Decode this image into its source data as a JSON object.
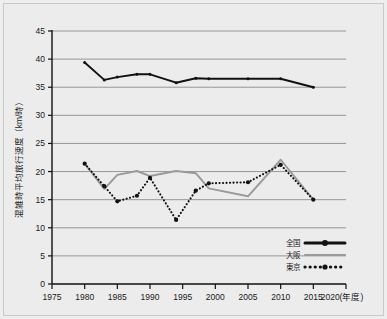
{
  "chart_data": {
    "type": "line",
    "title": "",
    "xlabel": "年度",
    "ylabel": "混雑時平均旅行速度（km/時）",
    "xlim": [
      1975,
      2020
    ],
    "ylim": [
      0,
      45
    ],
    "grid": true,
    "legend_position": "bottom-right",
    "x_ticks": [
      "1975",
      "1980",
      "1985",
      "1990",
      "1995",
      "2000",
      "2005",
      "2010",
      "2015",
      "2020"
    ],
    "x_axis_suffix": "(年度)",
    "y_ticks": [
      "0",
      "5",
      "10",
      "15",
      "20",
      "25",
      "30",
      "35",
      "40",
      "45"
    ],
    "series": [
      {
        "name": "全国",
        "color": "#111111",
        "style": "solid",
        "marker": "circle",
        "points": [
          {
            "x": 1980,
            "y": 39.4
          },
          {
            "x": 1983,
            "y": 36.3
          },
          {
            "x": 1985,
            "y": 36.8
          },
          {
            "x": 1988,
            "y": 37.3
          },
          {
            "x": 1990,
            "y": 37.3
          },
          {
            "x": 1994,
            "y": 35.8
          },
          {
            "x": 1997,
            "y": 36.6
          },
          {
            "x": 1999,
            "y": 36.5
          },
          {
            "x": 2005,
            "y": 36.5
          },
          {
            "x": 2010,
            "y": 36.5
          },
          {
            "x": 2015,
            "y": 35.0
          }
        ]
      },
      {
        "name": "大阪",
        "color": "#9a9a9a",
        "style": "solid",
        "marker": "none",
        "points": [
          {
            "x": 1980,
            "y": 21.4
          },
          {
            "x": 1983,
            "y": 16.9
          },
          {
            "x": 1985,
            "y": 19.4
          },
          {
            "x": 1988,
            "y": 20.1
          },
          {
            "x": 1990,
            "y": 19.2
          },
          {
            "x": 1994,
            "y": 20.1
          },
          {
            "x": 1997,
            "y": 19.7
          },
          {
            "x": 1999,
            "y": 17.0
          },
          {
            "x": 2005,
            "y": 15.6
          },
          {
            "x": 2010,
            "y": 22.1
          },
          {
            "x": 2015,
            "y": 15.0
          }
        ]
      },
      {
        "name": "東京",
        "color": "#111111",
        "style": "dotted",
        "marker": "circle",
        "points": [
          {
            "x": 1980,
            "y": 21.4
          },
          {
            "x": 1983,
            "y": 17.4
          },
          {
            "x": 1985,
            "y": 14.7
          },
          {
            "x": 1988,
            "y": 15.7
          },
          {
            "x": 1990,
            "y": 18.9
          },
          {
            "x": 1994,
            "y": 11.4
          },
          {
            "x": 1997,
            "y": 16.6
          },
          {
            "x": 1999,
            "y": 17.9
          },
          {
            "x": 2005,
            "y": 18.1
          },
          {
            "x": 2010,
            "y": 21.2
          },
          {
            "x": 2015,
            "y": 15.0
          }
        ]
      }
    ]
  }
}
